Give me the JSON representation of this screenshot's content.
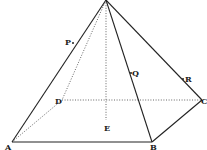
{
  "diagram": {
    "type": "square-based pyramid",
    "points": {
      "O": {
        "x": 106,
        "y": 0
      },
      "A": {
        "x": 12,
        "y": 142
      },
      "B": {
        "x": 152,
        "y": 142
      },
      "C": {
        "x": 202,
        "y": 100
      },
      "D": {
        "x": 62,
        "y": 100
      },
      "E": {
        "x": 106,
        "y": 120
      },
      "P": {
        "x": 73,
        "y": 43
      },
      "Q": {
        "x": 131,
        "y": 73
      },
      "R": {
        "x": 183,
        "y": 79
      }
    },
    "labels": {
      "A": "A",
      "B": "B",
      "C": "C",
      "D": "D",
      "E": "E",
      "P": "P",
      "Q": "Q",
      "R": "R"
    },
    "solid_edges": [
      [
        "O",
        "A"
      ],
      [
        "O",
        "B"
      ],
      [
        "O",
        "C"
      ],
      [
        "A",
        "B"
      ],
      [
        "B",
        "C"
      ]
    ],
    "dotted_edges": [
      [
        "O",
        "D"
      ],
      [
        "A",
        "D"
      ],
      [
        "D",
        "C"
      ],
      [
        "O",
        "E"
      ]
    ],
    "colors": {
      "line": "#222222",
      "hidden_line": "#555555",
      "label": "#1a1a1a",
      "background": "#ffffff"
    }
  }
}
